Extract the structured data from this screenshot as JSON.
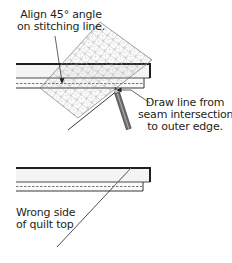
{
  "diagram": {
    "top_step": {
      "callout_align": {
        "line1": "Align 45° angle",
        "line2": "on stitching line."
      },
      "callout_draw": {
        "line1": "Draw line from",
        "line2": "seam intersection",
        "line3": "to outer edge."
      },
      "elements": [
        "border-strip",
        "quilt-top-strip",
        "stitching-line",
        "45-degree-grid-ruler",
        "pencil",
        "marked-diagonal-line"
      ]
    },
    "bottom_step": {
      "callout_wrong_side": {
        "line1": "Wrong side",
        "line2": "of quilt top"
      },
      "elements": [
        "border-strip",
        "quilt-top-strip",
        "stitching-line",
        "marked-diagonal-line"
      ]
    },
    "colors": {
      "line": "#231f20",
      "strip_fill": "#f4f4f4",
      "grid": "#8a8a8a",
      "background": "#ffffff"
    }
  }
}
